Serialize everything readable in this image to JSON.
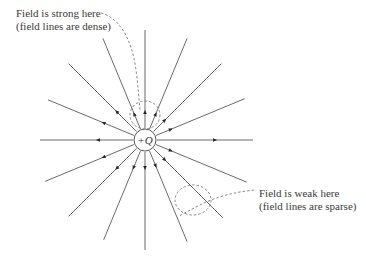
{
  "diagram": {
    "charge": {
      "sign": "+",
      "symbol": "Q",
      "label": "+Q",
      "cx": 145,
      "cy": 140,
      "r": 11
    },
    "field_lines": {
      "count": 16,
      "direction": "outward",
      "inner_radius": 12,
      "color": "#6a6a6a",
      "arrow_color": "#222222",
      "lines": [
        {
          "angle_deg": 0,
          "outer": 108,
          "arrow_at": 70
        },
        {
          "angle_deg": 22.5,
          "outer": 108,
          "arrow_at": 28
        },
        {
          "angle_deg": 45,
          "outer": 108,
          "arrow_at": 28
        },
        {
          "angle_deg": 67.5,
          "outer": 110,
          "arrow_at": 28
        },
        {
          "angle_deg": 90,
          "outer": 110,
          "arrow_at": 28
        },
        {
          "angle_deg": 112.5,
          "outer": 110,
          "arrow_at": 28
        },
        {
          "angle_deg": 135,
          "outer": 108,
          "arrow_at": 40
        },
        {
          "angle_deg": 157.5,
          "outer": 105,
          "arrow_at": 45
        },
        {
          "angle_deg": 180,
          "outer": 105,
          "arrow_at": 47
        },
        {
          "angle_deg": 202.5,
          "outer": 108,
          "arrow_at": 45
        },
        {
          "angle_deg": 225,
          "outer": 108,
          "arrow_at": 40
        },
        {
          "angle_deg": 247.5,
          "outer": 108,
          "arrow_at": 30
        },
        {
          "angle_deg": 270,
          "outer": 110,
          "arrow_at": 28
        },
        {
          "angle_deg": 292.5,
          "outer": 110,
          "arrow_at": 28
        },
        {
          "angle_deg": 315,
          "outer": 110,
          "arrow_at": 28
        },
        {
          "angle_deg": 337.5,
          "outer": 110,
          "arrow_at": 28
        }
      ]
    },
    "annotations": [
      {
        "id": "strong",
        "lines": [
          "Field is strong here",
          "(field lines are dense)"
        ],
        "x": 16,
        "y": 7
      },
      {
        "id": "weak",
        "lines": [
          "Field is weak here",
          "(field lines are sparse)"
        ],
        "x": 259,
        "y": 187
      }
    ],
    "dashed_regions": [
      {
        "id": "strong-region",
        "cx": 145,
        "cy": 115,
        "rx": 15,
        "ry": 14
      },
      {
        "id": "weak-region",
        "cx": 193,
        "cy": 200,
        "rx": 18,
        "ry": 15
      }
    ],
    "colors": {
      "background": "#ffffff",
      "line": "#6a6a6a",
      "dashed": "#7a7a7a",
      "text": "#3a3a3a"
    }
  }
}
